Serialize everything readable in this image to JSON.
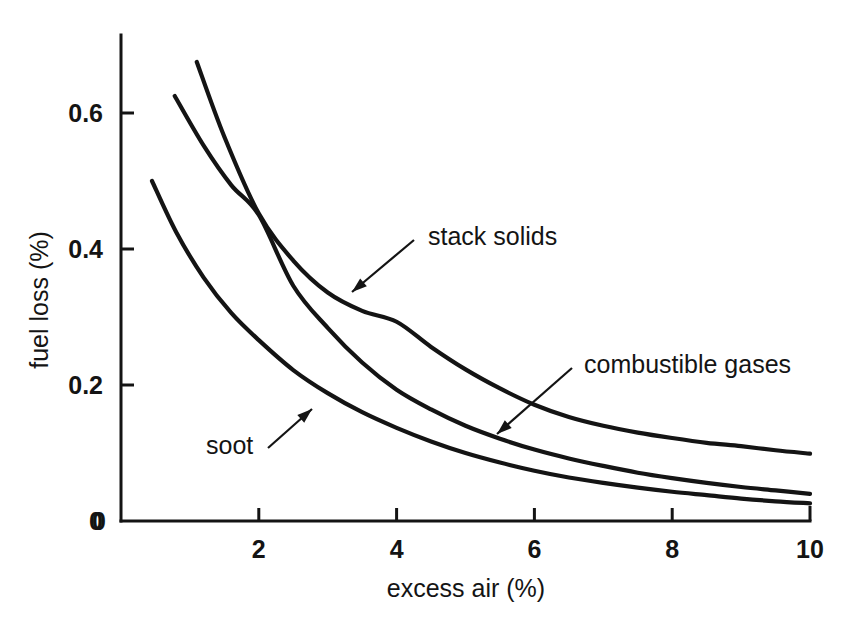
{
  "chart_data": {
    "type": "line",
    "title": "",
    "xlabel": "excess air (%)",
    "ylabel": "fuel loss (%)",
    "xlim": [
      0,
      10
    ],
    "ylim": [
      0,
      0.68
    ],
    "xticks": [
      "0",
      "2",
      "4",
      "6",
      "8",
      "10"
    ],
    "xtick_values": [
      0,
      2,
      4,
      6,
      8,
      10
    ],
    "yticks": [
      "0",
      "0.2",
      "0.4",
      "0.6"
    ],
    "ytick_values": [
      0,
      0.2,
      0.4,
      0.6
    ],
    "grid": false,
    "legend": "inline-annotations",
    "line_color": "#141414",
    "background": "#ffffff",
    "series": [
      {
        "name": "stack solids",
        "x": [
          1.1,
          1.5,
          2.0,
          2.5,
          3.0,
          3.5,
          4.0,
          4.5,
          5.0,
          5.5,
          6.0,
          6.5,
          7.0,
          7.5,
          8.0,
          8.5,
          9.0,
          9.5,
          10.0
        ],
        "values": [
          0.675,
          0.565,
          0.452,
          0.383,
          0.336,
          0.309,
          0.293,
          0.256,
          0.223,
          0.195,
          0.171,
          0.153,
          0.14,
          0.13,
          0.122,
          0.115,
          0.11,
          0.104,
          0.099
        ]
      },
      {
        "name": "combustible gases",
        "x": [
          0.78,
          1.2,
          1.6,
          2.0,
          2.5,
          3.0,
          3.5,
          4.0,
          4.5,
          5.0,
          5.5,
          6.0,
          6.5,
          7.0,
          7.5,
          8.0,
          8.5,
          9.0,
          9.5,
          10.0
        ],
        "values": [
          0.625,
          0.552,
          0.494,
          0.45,
          0.346,
          0.284,
          0.233,
          0.193,
          0.164,
          0.14,
          0.121,
          0.105,
          0.092,
          0.081,
          0.071,
          0.063,
          0.056,
          0.05,
          0.045,
          0.04
        ]
      },
      {
        "name": "soot",
        "x": [
          0.45,
          0.8,
          1.2,
          1.6,
          2.0,
          2.5,
          3.0,
          3.5,
          4.0,
          4.5,
          5.0,
          5.5,
          6.0,
          6.5,
          7.0,
          7.5,
          8.0,
          8.5,
          9.0,
          9.5,
          10.0
        ],
        "values": [
          0.5,
          0.425,
          0.358,
          0.306,
          0.266,
          0.222,
          0.188,
          0.16,
          0.137,
          0.117,
          0.1,
          0.086,
          0.074,
          0.064,
          0.056,
          0.049,
          0.043,
          0.038,
          0.033,
          0.029,
          0.026
        ]
      }
    ],
    "annotations": [
      {
        "label": "stack solids",
        "text_x": 428,
        "text_y": 245,
        "leader_from_x": 414,
        "leader_from_y": 240,
        "leader_to_x": 352,
        "leader_to_y": 292
      },
      {
        "label": "combustible gases",
        "text_x": 584,
        "text_y": 373,
        "leader_from_x": 572,
        "leader_from_y": 368,
        "leader_to_x": 497,
        "leader_to_y": 434
      },
      {
        "label": "soot",
        "text_x": 206,
        "text_y": 454,
        "leader_from_x": 268,
        "leader_from_y": 448,
        "leader_to_x": 312,
        "leader_to_y": 409
      }
    ]
  }
}
